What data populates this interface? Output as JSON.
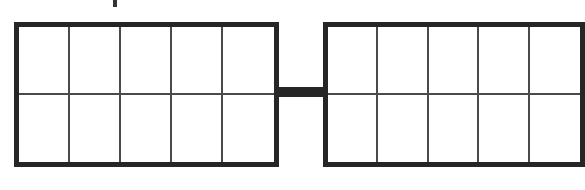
{
  "diagram": {
    "type": "double-ten-frame",
    "frames": [
      {
        "id": "left",
        "columns": 5,
        "rows": 2,
        "filled_cells": 0
      },
      {
        "id": "right",
        "columns": 5,
        "rows": 2,
        "filled_cells": 0
      }
    ],
    "connector": true,
    "colors": {
      "border": "#262626",
      "grid_line": "#4a4a4a",
      "background": "#ffffff"
    },
    "top_text": ""
  }
}
